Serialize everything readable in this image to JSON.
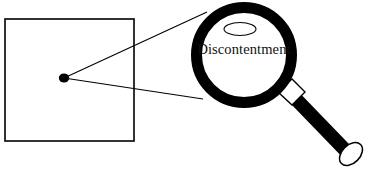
{
  "figure": {
    "background_color": "#ffffff",
    "stroke_color": "#000000",
    "fill_color": "#ffffff",
    "width": 369,
    "height": 172
  },
  "frame": {
    "name": "source-rectangle",
    "x": 5,
    "y": 19,
    "width": 129,
    "height": 122,
    "stroke_width": 1.6
  },
  "focus_point": {
    "name": "focus-dot",
    "cx": 64,
    "cy": 78,
    "rx": 5.2,
    "ry": 4.6,
    "color": "#000000"
  },
  "projection_lines": [
    {
      "name": "upper-projection-line",
      "x1": 64,
      "y1": 78,
      "x2": 207,
      "y2": 12,
      "stroke_width": 1.1
    },
    {
      "name": "lower-projection-line",
      "x1": 64,
      "y1": 78,
      "x2": 203,
      "y2": 99,
      "stroke_width": 1.1
    }
  ],
  "magnifier": {
    "lens_ring": {
      "name": "lens-ring",
      "cx": 244,
      "cy": 55,
      "outer_radius": 53,
      "ring_thickness": 11,
      "color": "#000000"
    },
    "lens_glass": {
      "name": "lens-glass",
      "cx": 244,
      "cy": 55,
      "radius": 42,
      "color": "#ffffff"
    },
    "highlight_ellipse": {
      "name": "lens-highlight-ellipse",
      "cx": 240,
      "cy": 29,
      "rx": 16,
      "ry": 6.5,
      "stroke_width": 1.1
    },
    "label": {
      "name": "magnified-word",
      "text": "Discontentment",
      "x": 244,
      "y": 54
    },
    "collar": {
      "name": "handle-collar",
      "points": "278,92 292,79 305,92 292,105",
      "stroke_width": 1.4
    },
    "shaft": {
      "name": "handle-shaft",
      "points": "288,100 297,91 352,148 343,157",
      "color": "#000000"
    },
    "end_cap": {
      "name": "handle-end-cap",
      "cx": 351,
      "cy": 154,
      "rx": 13.5,
      "ry": 9,
      "rotation": -45,
      "stroke_width": 1.5
    }
  }
}
